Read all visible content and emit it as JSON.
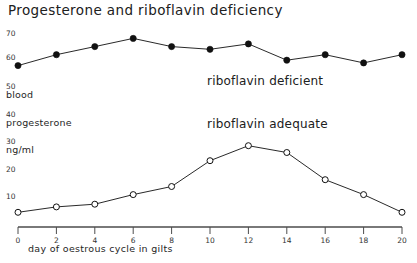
{
  "chart_data": {
    "type": "line",
    "title": "Progesterone and riboflavin  deficiency",
    "xlabel": "day  of  oestrous  cycle in gilts",
    "ylabel_lines": [
      "blood",
      "progesterone",
      "ng/ml"
    ],
    "x": [
      0,
      2,
      4,
      6,
      8,
      10,
      12,
      14,
      16,
      18,
      20
    ],
    "xticklabels": [
      "0",
      "2",
      "4",
      "6",
      "8",
      "10",
      "12",
      "14",
      "16",
      "18",
      "20"
    ],
    "xlim": [
      0,
      20
    ],
    "yticks": [
      10,
      20,
      30,
      40,
      50,
      60,
      70
    ],
    "yticklabels": [
      "10",
      "20",
      "30",
      "40",
      "50",
      "60",
      "70"
    ],
    "ylim": [
      0,
      73
    ],
    "grid": false,
    "legend": "inline-annotations",
    "series": [
      {
        "name": "riboflavin deficient",
        "marker": "filled-circle",
        "color": "#111111",
        "values": [
          58,
          62,
          65,
          68,
          65,
          64,
          66,
          60,
          62,
          59,
          62
        ]
      },
      {
        "name": "riboflavin adequate",
        "marker": "open-circle",
        "color": "#111111",
        "values": [
          4,
          6,
          7,
          10.5,
          13.5,
          23,
          28.5,
          26,
          16,
          10.5,
          4
        ]
      }
    ],
    "annotations": [
      {
        "text": "riboflavin deficient",
        "x_px": 207,
        "y_px": 74
      },
      {
        "text": "riboflavin adequate",
        "x_px": 207,
        "y_px": 117
      }
    ]
  },
  "axis": {
    "y_ticks": [
      {
        "label": "70",
        "y_px": 29
      },
      {
        "label": "60",
        "y_px": 53
      },
      {
        "label": "50",
        "y_px": 82
      },
      {
        "label": "40",
        "y_px": 110
      },
      {
        "label": "30",
        "y_px": 137
      },
      {
        "label": "20",
        "y_px": 165
      },
      {
        "label": "10",
        "y_px": 192
      }
    ],
    "y_names": [
      {
        "label": "blood",
        "y_px": 91
      },
      {
        "label": "progesterone",
        "y_px": 119
      },
      {
        "label": "ng/ml",
        "y_px": 146
      }
    ]
  },
  "colors": {
    "axis": "#4d4d4d",
    "line": "#2b2b2b",
    "marker_fill": "#111111",
    "marker_open_fill": "#ffffff",
    "text": "#202020",
    "background": "#ffffff"
  }
}
